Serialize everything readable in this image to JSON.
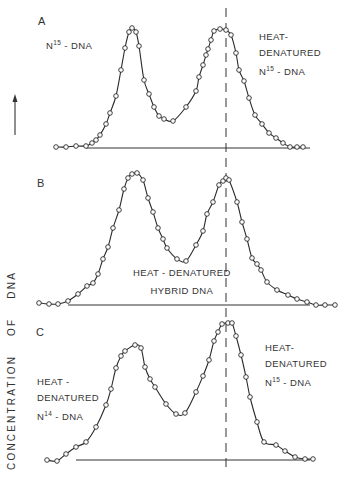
{
  "figure": {
    "y_axis_label": "CONCENTRATION OF DNA",
    "panels": [
      {
        "letter": "A",
        "labels": [
          {
            "lines": [
              "N15 - DNA"
            ],
            "x": 38,
            "y": 36
          },
          {
            "lines": [
              "HEAT-",
              "DENATURED",
              "N15 - DNA"
            ],
            "x": 259,
            "y": 28
          }
        ]
      },
      {
        "letter": "B",
        "labels": [
          {
            "lines": [
              "HEAT - DENATURED",
              "HYBRID DNA"
            ],
            "x": 133,
            "y": 262
          }
        ]
      },
      {
        "letter": "C",
        "labels": [
          {
            "lines": [
              "HEAT -",
              "DENATURED",
              "N14 - DNA"
            ],
            "x": 37,
            "y": 374
          },
          {
            "lines": [
              "HEAT-",
              "DENATURED",
              "N15 - DNA"
            ],
            "x": 265,
            "y": 338
          }
        ]
      }
    ]
  },
  "text": {
    "panel_a_letter": "A",
    "panel_a_left_label_pre": "N",
    "panel_a_left_label_sup": "15",
    "panel_a_left_label_post": " - DNA",
    "panel_a_right_line1": "HEAT-",
    "panel_a_right_line2": "DENATURED",
    "panel_a_right_line3_pre": "N",
    "panel_a_right_line3_sup": "15",
    "panel_a_right_line3_post": " - DNA",
    "panel_b_letter": "B",
    "panel_b_label_line1": "HEAT - DENATURED",
    "panel_b_label_line2": "HYBRID DNA",
    "panel_c_letter": "C",
    "panel_c_left_line1": "HEAT -",
    "panel_c_left_line2": "DENATURED",
    "panel_c_left_line3_pre": "N",
    "panel_c_left_line3_sup": "14",
    "panel_c_left_line3_post": " - DNA",
    "panel_c_right_line1": "HEAT-",
    "panel_c_right_line2": "DENATURED",
    "panel_c_right_line3_pre": "N",
    "panel_c_right_line3_sup": "15",
    "panel_c_right_line3_post": " - DNA",
    "y_axis_label": "CONCENTRATION OF DNA"
  },
  "chart_data": [
    {
      "type": "line",
      "title": "A",
      "xlabel": "",
      "ylabel": "CONCENTRATION OF DNA",
      "grid": false,
      "annotations": [
        "N15 - DNA",
        "HEAT-DENATURED N15 - DNA"
      ],
      "reference_line": {
        "style": "dashed",
        "x_px": 226
      },
      "baseline_px": 148,
      "series": [
        {
          "name": "A",
          "points_px": [
            [
              56,
              147
            ],
            [
              66,
              147
            ],
            [
              76,
              146
            ],
            [
              86,
              146
            ],
            [
              92,
              143
            ],
            [
              96,
              140
            ],
            [
              100,
              135
            ],
            [
              106,
              124
            ],
            [
              110,
              113
            ],
            [
              116,
              96
            ],
            [
              121,
              70
            ],
            [
              125,
              48
            ],
            [
              129,
              32
            ],
            [
              132,
              28
            ],
            [
              136,
              32
            ],
            [
              139,
              46
            ],
            [
              144,
              80
            ],
            [
              149,
              94
            ],
            [
              154,
              107
            ],
            [
              159,
              116
            ],
            [
              164,
              119
            ],
            [
              173,
              121
            ],
            [
              186,
              107
            ],
            [
              196,
              91
            ],
            [
              199,
              77
            ],
            [
              203,
              65
            ],
            [
              206,
              55
            ],
            [
              208,
              49
            ],
            [
              211,
              40
            ],
            [
              214,
              31
            ],
            [
              220,
              29
            ],
            [
              226,
              30
            ],
            [
              231,
              35
            ],
            [
              236,
              53
            ],
            [
              239,
              70
            ],
            [
              244,
              81
            ],
            [
              249,
              98
            ],
            [
              255,
              115
            ],
            [
              262,
              124
            ],
            [
              269,
              133
            ],
            [
              276,
              138
            ],
            [
              283,
              143
            ],
            [
              290,
              147
            ],
            [
              297,
              147
            ],
            [
              303,
              147
            ]
          ]
        }
      ]
    },
    {
      "type": "line",
      "title": "B",
      "xlabel": "",
      "ylabel": "CONCENTRATION OF DNA",
      "grid": false,
      "annotations": [
        "HEAT - DENATURED HYBRID DNA"
      ],
      "reference_line": {
        "style": "dashed",
        "x_px": 226
      },
      "baseline_px": 305,
      "series": [
        {
          "name": "B",
          "points_px": [
            [
              39,
              303
            ],
            [
              49,
              304
            ],
            [
              58,
              304
            ],
            [
              68,
              301
            ],
            [
              78,
              294
            ],
            [
              87,
              286
            ],
            [
              93,
              283
            ],
            [
              98,
              274
            ],
            [
              103,
              259
            ],
            [
              108,
              247
            ],
            [
              113,
              228
            ],
            [
              119,
              210
            ],
            [
              124,
              189
            ],
            [
              128,
              178
            ],
            [
              132,
              174
            ],
            [
              137,
              173
            ],
            [
              143,
              180
            ],
            [
              148,
              198
            ],
            [
              153,
              212
            ],
            [
              158,
              228
            ],
            [
              163,
              239
            ],
            [
              167,
              248
            ],
            [
              177,
              259
            ],
            [
              186,
              261
            ],
            [
              196,
              245
            ],
            [
              203,
              231
            ],
            [
              207,
              214
            ],
            [
              213,
              202
            ],
            [
              219,
              185
            ],
            [
              223,
              181
            ],
            [
              226,
              178
            ],
            [
              229,
              180
            ],
            [
              237,
              202
            ],
            [
              242,
              222
            ],
            [
              247,
              239
            ],
            [
              252,
              258
            ],
            [
              257,
              264
            ],
            [
              261,
              270
            ],
            [
              267,
              282
            ],
            [
              277,
              290
            ],
            [
              288,
              295
            ],
            [
              297,
              299
            ],
            [
              307,
              302
            ],
            [
              316,
              305
            ],
            [
              325,
              305
            ],
            [
              335,
              305
            ]
          ]
        }
      ]
    },
    {
      "type": "line",
      "title": "C",
      "xlabel": "",
      "ylabel": "CONCENTRATION OF DNA",
      "grid": false,
      "annotations": [
        "HEAT - DENATURED N14 - DNA",
        "HEAT-DENATURED N15 - DNA"
      ],
      "reference_line": {
        "style": "dashed",
        "x_px": 224
      },
      "baseline_px": 460,
      "series": [
        {
          "name": "C",
          "points_px": [
            [
              47,
              460
            ],
            [
              57,
              461
            ],
            [
              66,
              454
            ],
            [
              76,
              447
            ],
            [
              86,
              442
            ],
            [
              96,
              427
            ],
            [
              106,
              405
            ],
            [
              111,
              389
            ],
            [
              116,
              368
            ],
            [
              121,
              356
            ],
            [
              125,
              351
            ],
            [
              135,
              345
            ],
            [
              141,
              348
            ],
            [
              145,
              367
            ],
            [
              150,
              379
            ],
            [
              155,
              387
            ],
            [
              166,
              404
            ],
            [
              176,
              414
            ],
            [
              185,
              413
            ],
            [
              196,
              392
            ],
            [
              203,
              376
            ],
            [
              209,
              360
            ],
            [
              214,
              341
            ],
            [
              218,
              332
            ],
            [
              222,
              324
            ],
            [
              228,
              323
            ],
            [
              232,
              323
            ],
            [
              236,
              336
            ],
            [
              241,
              355
            ],
            [
              246,
              377
            ],
            [
              250,
              397
            ],
            [
              257,
              422
            ],
            [
              264,
              442
            ],
            [
              276,
              445
            ],
            [
              285,
              451
            ],
            [
              295,
              457
            ],
            [
              305,
              459
            ],
            [
              313,
              459
            ]
          ]
        }
      ]
    }
  ]
}
